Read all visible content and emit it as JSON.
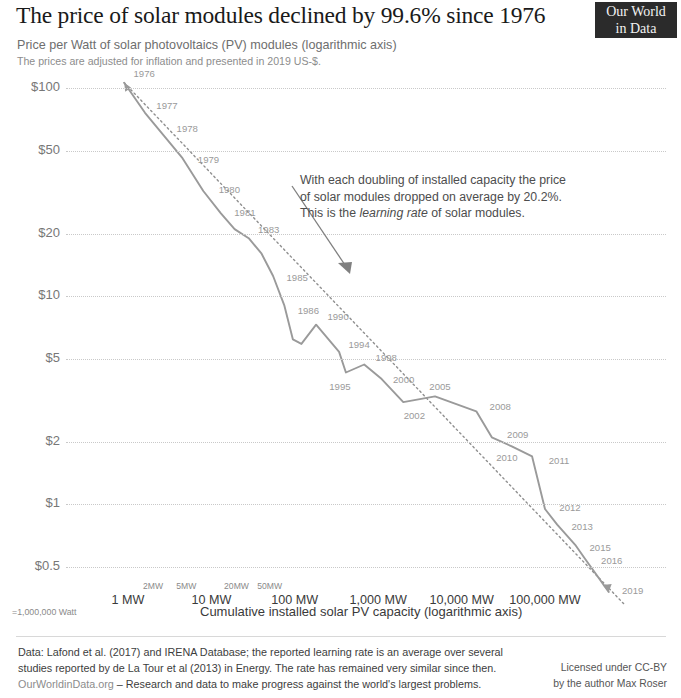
{
  "header": {
    "title": "The price of solar modules declined by 99.6% since 1976",
    "logo_line1": "Our World",
    "logo_line2": "in Data",
    "subtitle": "Price per Watt of solar photovoltaics (PV) modules (logarithmic axis)",
    "subnote": "The prices are adjusted for inflation and presented in 2019 US-$."
  },
  "annotation": {
    "line1": "With each doubling of installed capacity the price",
    "line2": "of solar modules dropped on average by 20.2%.",
    "line3_pre": "This is the ",
    "line3_em": "learning rate",
    "line3_post": " of solar modules."
  },
  "axis_note": "=1,000,000 Watt",
  "footer": {
    "line1": "Data: Lafond et al. (2017) and IRENA Database; the reported learning rate is an average over several",
    "line2": "studies reported by de La Tour et al (2013) in Energy. The rate has remained very similar since then.",
    "line3_link": "OurWorldinData.org",
    "line3_rest": " – Research and data to make progress against the world's largest problems.",
    "license1": "Licensed under CC-BY",
    "license2": "by the author Max Roser"
  },
  "colors": {
    "line": "#9a9a9a",
    "trend": "#8f8f8f",
    "grid": "#c9c9c9",
    "text": "#333333",
    "logo_bg": "#2b2b2b",
    "annotation_arrow": "#808080"
  },
  "chart_data": {
    "type": "line",
    "title": "The price of solar modules declined by 99.6% since 1976",
    "subtitle": "Price per Watt of solar photovoltaics (PV) modules (logarithmic axis)",
    "xlabel": "Cumulative installed solar PV capacity (logarithmic axis)",
    "ylabel": "Price per Watt (2019 US-$)",
    "xscale": "log",
    "yscale": "log",
    "xlim": [
      0.6,
      900000
    ],
    "ylim": [
      0.35,
      130
    ],
    "grid": true,
    "legend": false,
    "learning_rate_pct": 20.2,
    "y_ticks": [
      {
        "value": 100,
        "label": "$100"
      },
      {
        "value": 50,
        "label": "$50"
      },
      {
        "value": 20,
        "label": "$20"
      },
      {
        "value": 10,
        "label": "$10"
      },
      {
        "value": 5,
        "label": "$5"
      },
      {
        "value": 2,
        "label": "$2"
      },
      {
        "value": 1,
        "label": "$1"
      },
      {
        "value": 0.5,
        "label": "$0.5"
      }
    ],
    "x_ticks_major": [
      {
        "value": 1,
        "label": "1 MW"
      },
      {
        "value": 10,
        "label": "10 MW"
      },
      {
        "value": 100,
        "label": "100 MW"
      },
      {
        "value": 1000,
        "label": "1,000 MW"
      },
      {
        "value": 10000,
        "label": "10,000 MW"
      },
      {
        "value": 100000,
        "label": "100,000 MW"
      }
    ],
    "x_ticks_minor": [
      {
        "value": 2,
        "label": "2MW"
      },
      {
        "value": 5,
        "label": "5MW"
      },
      {
        "value": 20,
        "label": "20MW"
      },
      {
        "value": 50,
        "label": "50MW"
      }
    ],
    "series": [
      {
        "name": "Price per Watt vs cumulative capacity",
        "points": [
          {
            "year": 1976,
            "capacity_mw": 0.9,
            "price_usd": 106.0,
            "label": "1976"
          },
          {
            "year": 1977,
            "capacity_mw": 1.6,
            "price_usd": 76.0,
            "label": "1977"
          },
          {
            "year": 1978,
            "capacity_mw": 2.8,
            "price_usd": 58.0,
            "label": "1978"
          },
          {
            "year": 1979,
            "capacity_mw": 4.5,
            "price_usd": 46.0,
            "label": "1979"
          },
          {
            "year": 1980,
            "capacity_mw": 8.0,
            "price_usd": 32.0,
            "label": "1980"
          },
          {
            "year": 1981,
            "capacity_mw": 13.0,
            "price_usd": 25.0,
            "label": "1981"
          },
          {
            "year": 1982,
            "capacity_mw": 19.0,
            "price_usd": 21.0,
            "label": ""
          },
          {
            "year": 1983,
            "capacity_mw": 28.0,
            "price_usd": 19.0,
            "label": "1983"
          },
          {
            "year": 1984,
            "capacity_mw": 40.0,
            "price_usd": 16.0,
            "label": ""
          },
          {
            "year": 1985,
            "capacity_mw": 55.0,
            "price_usd": 12.5,
            "label": "1985"
          },
          {
            "year": 1986,
            "capacity_mw": 75.0,
            "price_usd": 9.0,
            "label": "1986"
          },
          {
            "year": 1987,
            "capacity_mw": 95.0,
            "price_usd": 6.2,
            "label": ""
          },
          {
            "year": 1988,
            "capacity_mw": 120.0,
            "price_usd": 5.9,
            "label": ""
          },
          {
            "year": 1990,
            "capacity_mw": 180.0,
            "price_usd": 7.3,
            "label": "1990"
          },
          {
            "year": 1994,
            "capacity_mw": 340.0,
            "price_usd": 5.4,
            "label": "1994"
          },
          {
            "year": 1995,
            "capacity_mw": 410.0,
            "price_usd": 4.3,
            "label": "1995"
          },
          {
            "year": 1998,
            "capacity_mw": 680.0,
            "price_usd": 4.7,
            "label": "1998"
          },
          {
            "year": 2000,
            "capacity_mw": 1100.0,
            "price_usd": 4.0,
            "label": "2000"
          },
          {
            "year": 2002,
            "capacity_mw": 2000.0,
            "price_usd": 3.1,
            "label": "2002"
          },
          {
            "year": 2005,
            "capacity_mw": 4800.0,
            "price_usd": 3.3,
            "label": "2005"
          },
          {
            "year": 2008,
            "capacity_mw": 15000.0,
            "price_usd": 2.8,
            "label": "2008"
          },
          {
            "year": 2009,
            "capacity_mw": 23000.0,
            "price_usd": 2.1,
            "label": "2009"
          },
          {
            "year": 2010,
            "capacity_mw": 40000.0,
            "price_usd": 1.9,
            "label": "2010"
          },
          {
            "year": 2011,
            "capacity_mw": 70000.0,
            "price_usd": 1.7,
            "label": "2011"
          },
          {
            "year": 2012,
            "capacity_mw": 100000.0,
            "price_usd": 0.95,
            "label": "2012"
          },
          {
            "year": 2013,
            "capacity_mw": 140000.0,
            "price_usd": 0.8,
            "label": "2013"
          },
          {
            "year": 2015,
            "capacity_mw": 230000.0,
            "price_usd": 0.64,
            "label": "2015"
          },
          {
            "year": 2016,
            "capacity_mw": 300000.0,
            "price_usd": 0.55,
            "label": "2016"
          },
          {
            "year": 2019,
            "capacity_mw": 580000.0,
            "price_usd": 0.38,
            "label": "2019"
          }
        ]
      }
    ],
    "trendline": {
      "name": "learning curve (20.2% per doubling)",
      "style": "dotted",
      "start": {
        "capacity_mw": 0.9,
        "price_usd": 106.0
      },
      "end": {
        "capacity_mw": 900000.0,
        "price_usd": 0.33
      }
    }
  }
}
